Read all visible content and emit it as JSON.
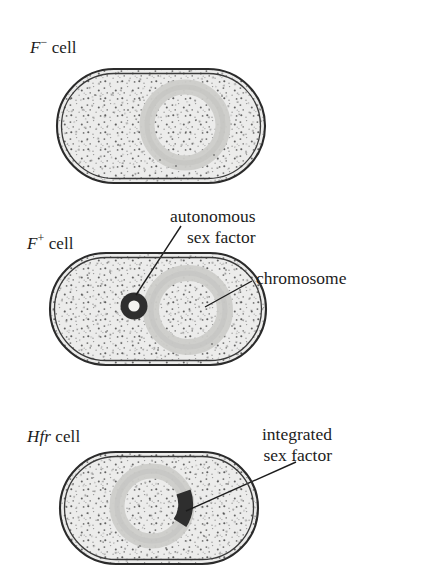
{
  "figure": {
    "kind": "biology-diagram",
    "background_color": "#ffffff",
    "ink_color": "#1c1c1c"
  },
  "cells": [
    {
      "id": "f-minus",
      "label_symbol": "F",
      "label_superscript": "−",
      "label_suffix": "cell",
      "label_plain": "F− cell",
      "has_autonomous_sex_factor": false,
      "has_integrated_sex_factor": false
    },
    {
      "id": "f-plus",
      "label_symbol": "F",
      "label_superscript": "+",
      "label_suffix": "cell",
      "label_plain": "F+ cell",
      "has_autonomous_sex_factor": true,
      "has_integrated_sex_factor": false
    },
    {
      "id": "hfr",
      "label_symbol": "Hfr",
      "label_superscript": "",
      "label_suffix": "cell",
      "label_plain": "Hfr cell",
      "has_autonomous_sex_factor": false,
      "has_integrated_sex_factor": true
    }
  ],
  "callouts": [
    {
      "id": "autonomous-sex-factor",
      "line1": "autonomous",
      "line2": "sex factor"
    },
    {
      "id": "chromosome",
      "line1": "chromosome",
      "line2": ""
    },
    {
      "id": "integrated-sex-factor",
      "line1": "integrated",
      "line2": "sex factor"
    }
  ],
  "colors": {
    "cytoplasm_fill": "#e9e9e7",
    "cell_wall_outer": "#2b2b2b",
    "cell_wall_inner": "#3a3a3a",
    "chromosome_ring": "#c9c9c7",
    "sex_factor_dark": "#2e2e2e",
    "stipple": "#4a4a4a",
    "leader_line": "#1c1c1c",
    "page_background": "#ffffff"
  }
}
